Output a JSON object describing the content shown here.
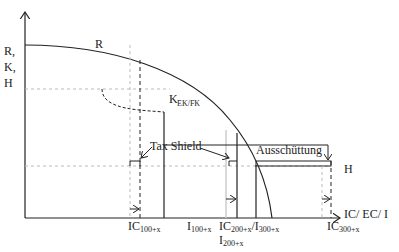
{
  "diagram": {
    "axes": {
      "y_label_lines": [
        "R,",
        "K,",
        "H"
      ],
      "x_label": "IC/ EC/ I"
    },
    "curves": {
      "R_label": "R",
      "K_label_main": "K",
      "K_label_sub": "EK/FK",
      "H_label": "H"
    },
    "annotations": {
      "tax_shield": "Tax Shield",
      "ausschuettung": "Ausschüttung"
    },
    "x_ticks": [
      {
        "main": "IC",
        "sub": "100+x"
      },
      {
        "main": "I",
        "sub": "100+x"
      },
      {
        "main": "IC",
        "sub": "200+x"
      },
      {
        "main": "/I",
        "sub": "300+x"
      },
      {
        "main": "I",
        "sub": "200+x"
      },
      {
        "main": "IC",
        "sub": "300+x"
      }
    ]
  }
}
